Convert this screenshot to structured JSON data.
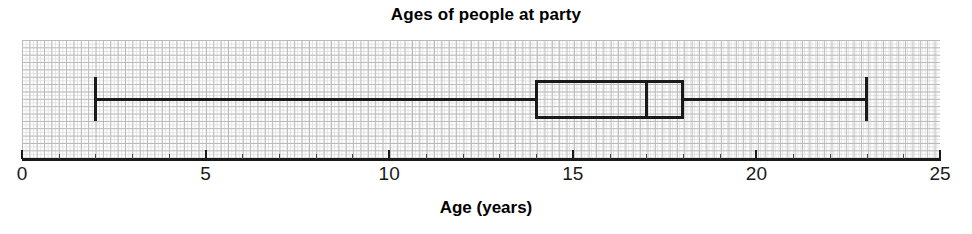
{
  "chart_data": {
    "type": "box",
    "title": "Ages of people at party",
    "xlabel": "Age (years)",
    "ylabel": "",
    "xlim": [
      0,
      25
    ],
    "xticks": [
      0,
      5,
      10,
      15,
      20,
      25
    ],
    "xtick_labels": [
      "0",
      "5",
      "10",
      "15",
      "20",
      "25"
    ],
    "minor_tick_step": 1,
    "grid": true,
    "grid_style": "graph-paper",
    "legend": "none",
    "orientation": "horizontal",
    "series": [
      {
        "name": "Ages of people at party",
        "min": 2,
        "q1": 14,
        "median": 17,
        "q3": 18,
        "max": 23,
        "iqr": 4,
        "range": 21,
        "outliers": []
      }
    ],
    "annotations": [],
    "colors": {
      "box_stroke": "#1a1a1a",
      "whisker": "#1a1a1a",
      "median": "#1a1a1a",
      "box_fill": "#ffffff",
      "grid_major": "#b9b9b9",
      "grid_minor": "#e2e2e2",
      "axis": "#1a1a1a",
      "background": "#ffffff"
    }
  },
  "title": "Ages of people at party",
  "xaxis": {
    "title": "Age (years)",
    "ticks": [
      {
        "value": 0,
        "label": "0"
      },
      {
        "value": 5,
        "label": "5"
      },
      {
        "value": 10,
        "label": "10"
      },
      {
        "value": 15,
        "label": "15"
      },
      {
        "value": 20,
        "label": "20"
      },
      {
        "value": 25,
        "label": "25"
      }
    ]
  },
  "box_summary": {
    "min_label": "2",
    "q1_label": "14",
    "median_label": "17",
    "q3_label": "18",
    "max_label": "23"
  }
}
